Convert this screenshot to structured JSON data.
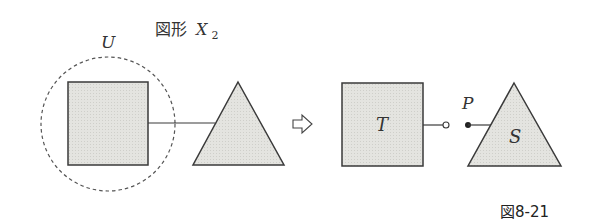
{
  "title": {
    "prefix": "図形",
    "var": "X",
    "sub": "2"
  },
  "left": {
    "circle_label": "U",
    "square_label": "",
    "triangle_label": ""
  },
  "arrow": {
    "icon": "hollow-right-arrow-icon"
  },
  "right": {
    "square_label": "T",
    "point_label": "P",
    "triangle_label": "S"
  },
  "caption": "図8-21",
  "colors": {
    "fill": "#e2e2de",
    "stroke": "#3a3a3a",
    "dash": "#555555"
  }
}
